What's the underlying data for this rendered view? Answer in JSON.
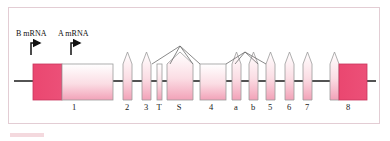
{
  "figure": {
    "background_color": "#ffffff",
    "border_color": "#e3cdd4"
  },
  "colors": {
    "exon_dark": "#ea4770",
    "exon_light_top": "#ffffff",
    "exon_light_bottom": "#f3a8bc",
    "outline": "#9b9b9b",
    "baseline": "#1a1a1a",
    "text": "#141414"
  },
  "promoters": [
    {
      "id": "promoter-b",
      "label": "B mRNA",
      "label_x": 16,
      "label_y": 36,
      "arrow_x": 31,
      "arrow_y": 42
    },
    {
      "id": "promoter-a",
      "label": "A mRNA",
      "label_x": 58,
      "label_y": 36,
      "arrow_x": 71,
      "arrow_y": 42
    }
  ],
  "baseline": {
    "x1": 14,
    "x2": 376,
    "y": 81
  },
  "exons": [
    {
      "label": "",
      "x": 33,
      "width": 29,
      "y": 64,
      "height": 36,
      "fill": "dark",
      "peak": false,
      "label_x": 0
    },
    {
      "label": "1",
      "x": 62,
      "width": 51,
      "y": 64,
      "height": 36,
      "fill": "light",
      "peak": false,
      "label_x": 74
    },
    {
      "label": "2",
      "x": 123,
      "width": 9,
      "y": 64,
      "height": 36,
      "fill": "light",
      "peak": true,
      "label_x": 127
    },
    {
      "label": "3",
      "x": 142,
      "width": 9,
      "y": 64,
      "height": 36,
      "fill": "light",
      "peak": true,
      "label_x": 146
    },
    {
      "label": "T",
      "x": 157,
      "width": 5,
      "y": 64,
      "height": 36,
      "fill": "light",
      "peak": false,
      "label_x": 159
    },
    {
      "label": "S",
      "x": 167,
      "width": 26,
      "y": 64,
      "height": 36,
      "fill": "light",
      "peak": true,
      "label_x": 179
    },
    {
      "label": "4",
      "x": 200,
      "width": 26,
      "y": 64,
      "height": 36,
      "fill": "light",
      "peak": false,
      "label_x": 211
    },
    {
      "label": "a",
      "x": 232,
      "width": 9,
      "y": 64,
      "height": 36,
      "fill": "light",
      "peak": true,
      "label_x": 236
    },
    {
      "label": "b",
      "x": 249,
      "width": 9,
      "y": 64,
      "height": 36,
      "fill": "light",
      "peak": true,
      "label_x": 253
    },
    {
      "label": "5",
      "x": 266,
      "width": 9,
      "y": 64,
      "height": 36,
      "fill": "light",
      "peak": true,
      "label_x": 270
    },
    {
      "label": "6",
      "x": 285,
      "width": 9,
      "y": 64,
      "height": 36,
      "fill": "light",
      "peak": true,
      "label_x": 289
    },
    {
      "label": "7",
      "x": 303,
      "width": 9,
      "y": 64,
      "height": 36,
      "fill": "light",
      "peak": true,
      "label_x": 307
    },
    {
      "label": "8",
      "x": 330,
      "width": 9,
      "y": 64,
      "height": 36,
      "fill": "light",
      "peak": true,
      "label_x": 0
    },
    {
      "label": "8",
      "x": 339,
      "width": 28,
      "y": 64,
      "height": 36,
      "fill": "dark",
      "peak": false,
      "label_x": 348
    }
  ],
  "splice_arcs": [
    {
      "id": "arc-S-high",
      "points": "170,64 180,46 193,64"
    },
    {
      "id": "arc-S-left",
      "points": "152,64 180,46"
    },
    {
      "id": "arc-S-right",
      "points": "180,46 200,64"
    },
    {
      "id": "arc-ab-high",
      "points": "235,64 245,52 258,64"
    },
    {
      "id": "arc-ab-left",
      "points": "226,64 245,52"
    },
    {
      "id": "arc-ab-right",
      "points": "245,52 266,64"
    }
  ],
  "labels_row_y": 110
}
